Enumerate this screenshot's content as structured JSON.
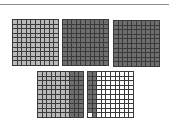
{
  "diagram": {
    "title": "",
    "colors": {
      "grid_line": "#3a3a3a",
      "light_shade": "#b9b9b9",
      "dark_shade": "#6e6e6e",
      "unshaded": "#ffffff",
      "top_rule": "#8a8a8a"
    },
    "grids": [
      {
        "id": "grid-1",
        "left": 12,
        "top": 19,
        "rows": 10,
        "cols": 10,
        "shading": "all-light",
        "shaded_cells": 100
      },
      {
        "id": "grid-2",
        "left": 62,
        "top": 19,
        "rows": 10,
        "cols": 10,
        "shading": "all-dark",
        "shaded_cells": 100
      },
      {
        "id": "grid-3",
        "left": 113,
        "top": 20,
        "rows": 10,
        "cols": 10,
        "shading": "all-dark",
        "shaded_cells": 100
      },
      {
        "id": "grid-4",
        "left": 37,
        "top": 71,
        "rows": 10,
        "cols": 10,
        "shading": "7 light columns + 3 dark columns",
        "light_columns": 7,
        "dark_columns": 3,
        "shaded_cells": 100
      },
      {
        "id": "grid-5",
        "left": 87,
        "top": 71,
        "rows": 10,
        "cols": 10,
        "shading": "2 dark columns, bottom cell of first column unshaded",
        "dark_columns": 2,
        "shaded_cells": 19
      }
    ]
  }
}
